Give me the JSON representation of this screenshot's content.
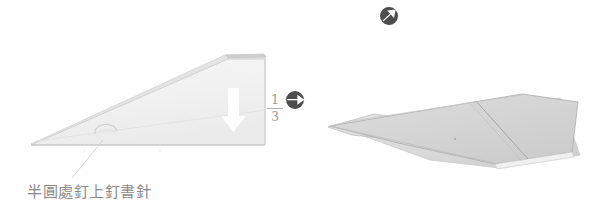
{
  "page": {
    "background_color": "#ffffff",
    "width": 604,
    "height": 213
  },
  "caption": {
    "text": "半圓處釘上釘書針",
    "color": "#8a8a8a"
  },
  "measurement_label": {
    "name": "one-third-fraction",
    "numerator": "1",
    "denominator": "3",
    "color": "#9a9a9a"
  },
  "icons": [
    {
      "name": "rotate-right-icon",
      "glyph": "circular-arrow-right",
      "color": "#4d4d4d"
    },
    {
      "name": "rotate-diagonal-icon",
      "glyph": "circular-arrow-up-right",
      "color": "#4d4d4d"
    }
  ],
  "shapes": {
    "left_figure": {
      "name": "folded-paper-triangle-before",
      "fill": "#f2f2f2",
      "stroke": "#c9c9c9",
      "fold_line_color": "#dcdcdc",
      "arrow_color": "#ffffff",
      "semicircle_mark_color": "#cfcfcf"
    },
    "right_figure": {
      "name": "folded-paper-triangle-after",
      "fill": "#d6d6d6",
      "stroke": "#b0b0b0",
      "fold_line_color": "#9f9f9f"
    }
  },
  "leader_line": {
    "name": "caption-leader-line",
    "color": "#d5d5d5"
  }
}
